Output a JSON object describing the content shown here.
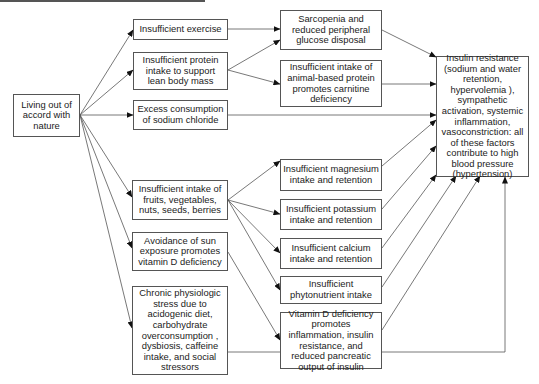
{
  "diagram": {
    "root": {
      "label": "Living out of accord with nature"
    },
    "causes": [
      {
        "id": "exercise",
        "label": "Insufficient exercise"
      },
      {
        "id": "protein",
        "label": "Insufficient protein intake to support lean body mass"
      },
      {
        "id": "sodium",
        "label": "Excess consumption of sodium chloride"
      },
      {
        "id": "fruits",
        "label": "Insufficient intake of fruits, vegetables, nuts, seeds, berries"
      },
      {
        "id": "sun",
        "label": "Avoidance of sun exposure promotes vitamin D deficiency"
      },
      {
        "id": "stress",
        "label": "Chronic physiologic stress due to acidogenic diet, carbohydrate overconsumption , dysbiosis, caffeine intake, and social stressors"
      }
    ],
    "mechanisms": [
      {
        "id": "sarcopenia",
        "label": "Sarcopenia and reduced peripheral glucose disposal"
      },
      {
        "id": "carnitine",
        "label": "Insufficient intake of animal-based protein promotes carnitine deficiency"
      },
      {
        "id": "magnesium",
        "label": "Insufficient magnesium intake and retention"
      },
      {
        "id": "potassium",
        "label": "Insufficient potassium intake and retention"
      },
      {
        "id": "calcium",
        "label": "Insufficient calcium intake and retention"
      },
      {
        "id": "phyto",
        "label": "Insufficient phytonutrient intake"
      },
      {
        "id": "vitd",
        "label": "Vitamin D deficiency promotes inflammation, insulin resistance, and reduced pancreatic output of insulin"
      }
    ],
    "outcome": {
      "label": "Insulin resistance (sodium and water retention, hypervolemia ), sympathetic activation, systemic inflammation, vasoconstriction: all of these factors contribute to high blood pressure (hypertension)"
    },
    "colors": {
      "line": "#555555",
      "arrow": "#111111",
      "box_border": "#555555",
      "text": "#222222"
    }
  }
}
